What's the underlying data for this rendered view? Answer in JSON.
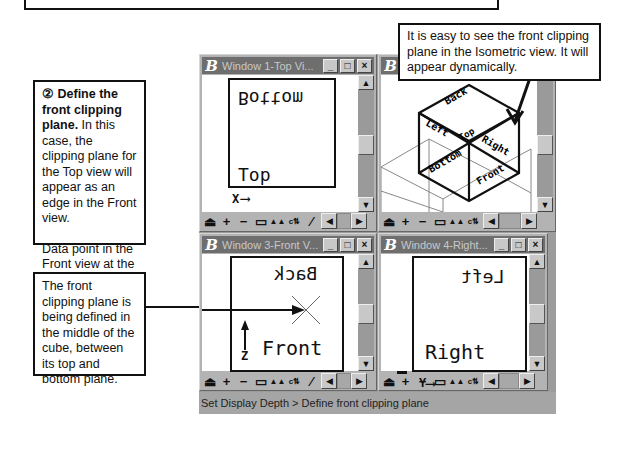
{
  "callouts": {
    "step": {
      "number": "②",
      "title": "Define the front clipping plane.",
      "text": "In this case, the clipping plane for the Top view will appear as an edge in the Front view.",
      "text2": "Data point in the Front view at the elevation wanted for the front clipping plane."
    },
    "middle": "The front clipping plane is being defined in the middle of the cube, between its top and bottom plane.",
    "isometric": "It is easy to see the front clipping plane in the Isometric view.  It will appear dynamically."
  },
  "windows": [
    {
      "title": "Window 1-Top Vi...",
      "labels": {
        "upper": "Bottom",
        "lower": "Top",
        "axis": "X"
      }
    },
    {
      "title": "Window 2-Iso",
      "labels": {
        "faces": [
          "Back",
          "Left",
          "Top",
          "Right",
          "Bottom",
          "Front"
        ]
      }
    },
    {
      "title": "Window 3-Front V...",
      "labels": {
        "upper": "Back",
        "lower": "Front",
        "axis": "Z"
      }
    },
    {
      "title": "Window 4-Right...",
      "labels": {
        "upper": "Left",
        "lower": "Right",
        "axis": "Y"
      }
    }
  ],
  "title_buttons": {
    "minimize": "_",
    "maximize": "□",
    "close": "×"
  },
  "toolbar": {
    "icons": [
      "update-view",
      "zoom-in",
      "zoom-out",
      "window-area",
      "fit-view",
      "rotate-view",
      "pan-view"
    ]
  },
  "scroll": {
    "up": "▲",
    "down": "▼",
    "left": "◀",
    "right": "▶"
  },
  "status": {
    "text": "Set Display Depth > Define front clipping plane"
  }
}
